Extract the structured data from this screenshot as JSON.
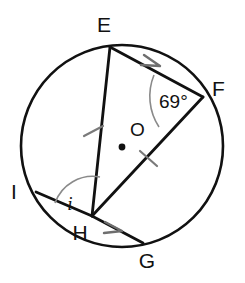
{
  "figure": {
    "type": "circle-geometry-diagram",
    "stroke_color": "#111111",
    "accent_color": "#8a8a8a",
    "background_color": "#ffffff"
  },
  "circle": {
    "center_label": "O",
    "center_x": 122,
    "center_y": 146,
    "radius": 101
  },
  "points": [
    {
      "name": "E",
      "label": "E",
      "x": 110,
      "y": 47,
      "label_x": 104,
      "label_y": 32
    },
    {
      "name": "F",
      "label": "F",
      "x": 203,
      "y": 97,
      "label_x": 210,
      "label_y": 95
    },
    {
      "name": "G",
      "label": "G",
      "x": 143,
      "y": 243,
      "label_x": 143,
      "label_y": 268
    },
    {
      "name": "H",
      "label": "H",
      "x": 92,
      "y": 216,
      "label_x": 71,
      "label_y": 240
    },
    {
      "name": "I",
      "label": "I",
      "x": 36,
      "y": 192,
      "label_x": 10,
      "label_y": 198
    }
  ],
  "segments": [
    {
      "name": "segment-EF",
      "from": "E",
      "to": "F",
      "arrow": true,
      "tick": false
    },
    {
      "name": "segment-EH",
      "from": "E",
      "to": "H",
      "arrow": false,
      "tick": true
    },
    {
      "name": "segment-HF",
      "from": "H",
      "to": "F",
      "arrow": false,
      "tick": true
    },
    {
      "name": "segment-HI",
      "from": "H",
      "to": "I",
      "arrow": false,
      "tick": false
    },
    {
      "name": "segment-HG",
      "from": "H",
      "to": "G",
      "arrow": true,
      "tick": false
    }
  ],
  "angles": [
    {
      "name": "angle-at-F",
      "vertex": "F",
      "label": "69°",
      "value": 69,
      "unit": "degrees",
      "label_x": 159,
      "label_y": 108,
      "rays": [
        "FE",
        "FH"
      ]
    },
    {
      "name": "angle-at-H",
      "vertex": "H",
      "label": "i",
      "value": null,
      "unit": "unknown",
      "label_x": 68,
      "label_y": 210,
      "rays": [
        "HI",
        "HE"
      ]
    }
  ],
  "tick_marks": [
    {
      "name": "tick-on-EH",
      "x": 93,
      "y": 131
    },
    {
      "name": "tick-on-HF",
      "x": 148,
      "y": 158
    }
  ],
  "arrow_markers": [
    {
      "name": "arrow-on-EF",
      "x": 152,
      "y": 63
    },
    {
      "name": "arrow-on-HG",
      "x": 114,
      "y": 229
    }
  ]
}
